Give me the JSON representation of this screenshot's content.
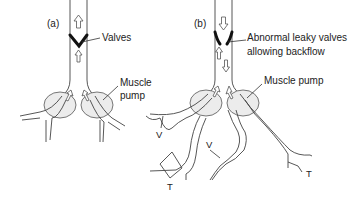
{
  "diagram": {
    "panels": [
      {
        "id": "a",
        "label": "(a)",
        "valve_label": "Valves",
        "muscle_label_line1": "Muscle",
        "muscle_label_line2": "pump"
      },
      {
        "id": "b",
        "label": "(b)",
        "valve_label_line1": "Abnormal leaky valves",
        "valve_label_line2": "allowing backflow",
        "muscle_label": "Muscle pump",
        "vein_markers": [
          "V",
          "V"
        ],
        "tributary_markers": [
          "T",
          "T"
        ]
      }
    ],
    "colors": {
      "line": "#444444",
      "valve": "#111111",
      "muscle_fill": "#ececec",
      "background": "#ffffff"
    }
  }
}
